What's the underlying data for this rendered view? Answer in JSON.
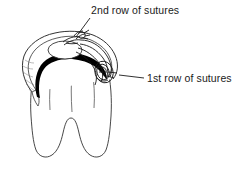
{
  "figure": {
    "type": "line-art-medical-illustration",
    "background_color": "#ffffff",
    "line_color": "#1a1a1a",
    "shadow_color": "#000000"
  },
  "labels": {
    "second_row": {
      "text": "2nd row of sutures",
      "leader": "diagonal line from label down-left to upper suture knot"
    },
    "first_row": {
      "text": "1st row of sutures",
      "leader": "short horizontal line from label left to right-side suture knot"
    }
  },
  "anatomy": {
    "tooth_crown": "crown",
    "tooth_roots": "two roots",
    "gum_flap": "gingival flap",
    "dark_band": "shadow under flap margin",
    "occlusal_surface": "occlusal oval"
  }
}
